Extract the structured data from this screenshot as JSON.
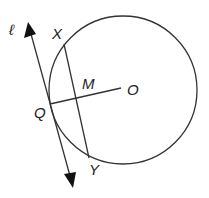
{
  "diagram": {
    "labels": {
      "line": "ℓ",
      "X": "X",
      "M": "M",
      "O": "O",
      "Q": "Q",
      "Y": "Y"
    },
    "stroke_color": "#333333"
  }
}
